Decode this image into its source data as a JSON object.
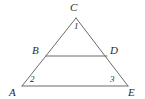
{
  "figure": {
    "type": "geometry-diagram",
    "shape": "triangle-with-parallel-segment",
    "background_color": "#ffffff",
    "stroke_color": "#6b6b6b",
    "text_color": "#2b2b2b",
    "stroke_width": 1
  },
  "vertices": {
    "C": {
      "label": "C",
      "x": 76,
      "y": 18
    },
    "B": {
      "label": "B",
      "x": 46,
      "y": 56
    },
    "D": {
      "label": "D",
      "x": 107,
      "y": 56
    },
    "A": {
      "label": "A",
      "x": 22,
      "y": 86
    },
    "E": {
      "label": "E",
      "x": 128,
      "y": 86
    }
  },
  "angles": {
    "one": {
      "label": "1",
      "at_vertex": "C"
    },
    "two": {
      "label": "2",
      "at_vertex": "A"
    },
    "three": {
      "label": "3",
      "at_vertex": "E"
    }
  },
  "segments": [
    {
      "name": "CA",
      "from": "C",
      "to": "A"
    },
    {
      "name": "CE",
      "from": "C",
      "to": "E"
    },
    {
      "name": "AE",
      "from": "A",
      "to": "E"
    },
    {
      "name": "BD",
      "from": "B",
      "to": "D"
    }
  ]
}
